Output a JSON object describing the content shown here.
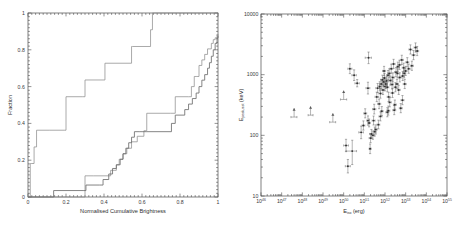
{
  "figure": {
    "panel_count": 2
  },
  "chart_data": [
    {
      "type": "line",
      "panel": "left",
      "title": "",
      "xlabel": "Normalised Cumulative Brightness",
      "ylabel": "Fraction",
      "xlim": [
        0,
        1
      ],
      "ylim": [
        0,
        1
      ],
      "xticks": [
        0,
        0.2,
        0.4,
        0.6,
        0.8,
        1
      ],
      "xticklabels": [
        "0",
        "0.2",
        "0.4",
        "0.6",
        "0.8",
        "1"
      ],
      "yticks": [
        0,
        0.2,
        0.4,
        0.6,
        0.8,
        1
      ],
      "yticklabels": [
        "0",
        "0.2",
        "0.4",
        "0.6",
        "0.8",
        "1"
      ],
      "grid": false,
      "legend": "none",
      "drawstyle": "steps-post",
      "series": [
        {
          "name": "upper-left cumulative distribution",
          "color": "#8d8d8d",
          "x": [
            0.0,
            0.012,
            0.02,
            0.032,
            0.045,
            0.115,
            0.19,
            0.2,
            0.285,
            0.3,
            0.4,
            0.405,
            0.5,
            0.545,
            0.55,
            0.645,
            0.655,
            1.0
          ],
          "y": [
            0.0,
            0.182,
            0.182,
            0.272,
            0.363,
            0.363,
            0.363,
            0.545,
            0.545,
            0.636,
            0.636,
            0.727,
            0.727,
            0.818,
            0.818,
            0.909,
            1.0,
            1.0
          ]
        },
        {
          "name": "lower-right cumulative distribution (thin)",
          "color": "#8d8d8d",
          "x": [
            0.0,
            0.125,
            0.29,
            0.3,
            0.345,
            0.4,
            0.435,
            0.465,
            0.48,
            0.5,
            0.52,
            0.545,
            0.575,
            0.61,
            0.625,
            0.75,
            0.775,
            0.8,
            0.845,
            0.86,
            0.875,
            0.885,
            0.9,
            0.915,
            0.93,
            0.945,
            0.955,
            0.965,
            0.975,
            0.985,
            0.995,
            1.0
          ],
          "y": [
            0.0,
            0.0,
            0.0,
            0.115,
            0.115,
            0.115,
            0.145,
            0.175,
            0.205,
            0.235,
            0.265,
            0.3,
            0.33,
            0.36,
            0.455,
            0.455,
            0.545,
            0.545,
            0.545,
            0.6,
            0.655,
            0.655,
            0.715,
            0.745,
            0.775,
            0.805,
            0.805,
            0.835,
            0.855,
            0.865,
            0.875,
            0.885
          ]
        },
        {
          "name": "lower-right cumulative distribution (thick)",
          "color": "#6e6e6e",
          "x": [
            0.0,
            0.125,
            0.135,
            0.29,
            0.305,
            0.375,
            0.395,
            0.425,
            0.445,
            0.465,
            0.485,
            0.5,
            0.515,
            0.53,
            0.545,
            0.56,
            0.585,
            0.605,
            0.625,
            0.7,
            0.755,
            0.775,
            0.8,
            0.825,
            0.845,
            0.865,
            0.885,
            0.9,
            0.915,
            0.93,
            0.945,
            0.955,
            0.965,
            0.975,
            0.985,
            0.995,
            1.0
          ],
          "y": [
            0.0,
            0.0,
            0.035,
            0.035,
            0.065,
            0.065,
            0.095,
            0.125,
            0.155,
            0.175,
            0.205,
            0.235,
            0.265,
            0.295,
            0.325,
            0.355,
            0.355,
            0.355,
            0.355,
            0.355,
            0.4,
            0.445,
            0.445,
            0.475,
            0.505,
            0.535,
            0.565,
            0.6,
            0.635,
            0.665,
            0.7,
            0.73,
            0.765,
            0.8,
            0.835,
            0.865,
            0.875
          ]
        }
      ]
    },
    {
      "type": "scatter",
      "panel": "right",
      "title": "",
      "xlabel": "E_iso (erg)",
      "xlabel_base": "E",
      "xlabel_sub": "iso",
      "xlabel_unit": "(erg)",
      "ylabel": "E_peak,rest (keV)",
      "ylabel_base": "E",
      "ylabel_sub": "peak,rest",
      "ylabel_unit": "(keV)",
      "xscale": "log",
      "yscale": "log",
      "xlim": [
        1e+46,
        1e+55
      ],
      "ylim": [
        10,
        10000
      ],
      "xticks_exp": [
        46,
        47,
        48,
        49,
        50,
        51,
        52,
        53,
        54,
        55
      ],
      "yticklabels": [
        "10",
        "100",
        "1000",
        "10000"
      ],
      "yticks": [
        10,
        100,
        1000,
        10000
      ],
      "grid": false,
      "legend": "none",
      "marker_kinds": [
        "point-with-errorbars",
        "lower-limit-arrow"
      ],
      "points": [
        {
          "x": 4e+47,
          "y": 200,
          "xerr_lo": 1.2e+47,
          "xerr_hi": 1.5e+47,
          "yerr_lo": 0,
          "yerr_hi": 0,
          "limit": "lower"
        },
        {
          "x": 2.5e+48,
          "y": 215,
          "xerr_lo": 6e+47,
          "xerr_hi": 8e+47,
          "yerr_lo": 0,
          "yerr_hi": 0,
          "limit": "lower"
        },
        {
          "x": 3e+49,
          "y": 165,
          "xerr_lo": 9e+48,
          "xerr_hi": 1.1e+49,
          "yerr_lo": 0,
          "yerr_hi": 0,
          "limit": "lower"
        },
        {
          "x": 1e+50,
          "y": 390,
          "xerr_lo": 3e+49,
          "xerr_hi": 4e+49,
          "yerr_lo": 0,
          "yerr_hi": 0,
          "limit": "lower"
        },
        {
          "x": 2e+50,
          "y": 1250,
          "xerr_lo": 4e+49,
          "xerr_hi": 5e+49,
          "yerr_lo": 210,
          "yerr_hi": 260
        },
        {
          "x": 3.2e+50,
          "y": 980,
          "xerr_lo": 7e+49,
          "xerr_hi": 9e+49,
          "yerr_lo": 180,
          "yerr_hi": 220
        },
        {
          "x": 4.5e+50,
          "y": 720,
          "xerr_lo": 1e+50,
          "xerr_hi": 1.2e+50,
          "yerr_lo": 90,
          "yerr_hi": 110
        },
        {
          "x": 1.3e+50,
          "y": 68,
          "xerr_lo": 3e+49,
          "xerr_hi": 4e+49,
          "yerr_lo": 14,
          "yerr_hi": 18
        },
        {
          "x": 1.6e+50,
          "y": 31,
          "xerr_lo": 4e+49,
          "xerr_hi": 5e+49,
          "yerr_lo": 7,
          "yerr_hi": 9
        },
        {
          "x": 2.6e+50,
          "y": 55,
          "xerr_lo": 1.3e+50,
          "xerr_hi": 1.6e+50,
          "yerr_lo": 22,
          "yerr_hi": 28
        },
        {
          "x": 7e+50,
          "y": 112,
          "xerr_lo": 1.6e+50,
          "xerr_hi": 2e+50,
          "yerr_lo": 24,
          "yerr_hi": 30
        },
        {
          "x": 1.6e+51,
          "y": 1900,
          "xerr_lo": 5e+50,
          "xerr_hi": 6e+50,
          "yerr_lo": 380,
          "yerr_hi": 460
        },
        {
          "x": 1.5e+51,
          "y": 600,
          "xerr_lo": 3e+50,
          "xerr_hi": 3.5e+50,
          "yerr_lo": 120,
          "yerr_hi": 150
        },
        {
          "x": 1.5e+51,
          "y": 175,
          "xerr_lo": 2e+50,
          "xerr_hi": 2.5e+50,
          "yerr_lo": 28,
          "yerr_hi": 34
        },
        {
          "x": 1.7e+51,
          "y": 160,
          "xerr_lo": 2e+50,
          "xerr_hi": 2.5e+50,
          "yerr_lo": 22,
          "yerr_hi": 26
        },
        {
          "x": 1.9e+51,
          "y": 60,
          "xerr_lo": 2e+50,
          "xerr_hi": 2.5e+50,
          "yerr_lo": 10,
          "yerr_hi": 12
        },
        {
          "x": 2.2e+51,
          "y": 105,
          "xerr_lo": 4e+50,
          "xerr_hi": 5e+50,
          "yerr_lo": 16,
          "yerr_hi": 20
        },
        {
          "x": 2.6e+51,
          "y": 100,
          "xerr_lo": 3e+50,
          "xerr_hi": 4e+50,
          "yerr_lo": 14,
          "yerr_hi": 18
        },
        {
          "x": 3e+51,
          "y": 270,
          "xerr_lo": 5e+50,
          "xerr_hi": 6e+50,
          "yerr_lo": 45,
          "yerr_hi": 55
        },
        {
          "x": 3.2e+51,
          "y": 115,
          "xerr_lo": 4e+50,
          "xerr_hi": 5e+50,
          "yerr_lo": 18,
          "yerr_hi": 22
        },
        {
          "x": 3.6e+51,
          "y": 125,
          "xerr_lo": 5e+50,
          "xerr_hi": 6e+50,
          "yerr_lo": 20,
          "yerr_hi": 24
        },
        {
          "x": 4e+51,
          "y": 430,
          "xerr_lo": 7e+50,
          "xerr_hi": 9e+50,
          "yerr_lo": 70,
          "yerr_hi": 85
        },
        {
          "x": 4.4e+51,
          "y": 600,
          "xerr_lo": 8e+50,
          "xerr_hi": 1e+51,
          "yerr_lo": 95,
          "yerr_hi": 115
        },
        {
          "x": 4.8e+51,
          "y": 150,
          "xerr_lo": 6e+50,
          "xerr_hi": 8e+50,
          "yerr_lo": 22,
          "yerr_hi": 28
        },
        {
          "x": 5.2e+51,
          "y": 330,
          "xerr_lo": 8e+50,
          "xerr_hi": 1e+51,
          "yerr_lo": 55,
          "yerr_hi": 65
        },
        {
          "x": 5.6e+51,
          "y": 640,
          "xerr_lo": 9e+50,
          "xerr_hi": 1.1e+51,
          "yerr_lo": 100,
          "yerr_hi": 125
        },
        {
          "x": 6e+51,
          "y": 490,
          "xerr_lo": 1e+51,
          "xerr_hi": 1.2e+51,
          "yerr_lo": 80,
          "yerr_hi": 95
        },
        {
          "x": 6.5e+51,
          "y": 700,
          "xerr_lo": 1.1e+51,
          "xerr_hi": 1.3e+51,
          "yerr_lo": 110,
          "yerr_hi": 135
        },
        {
          "x": 7e+51,
          "y": 250,
          "xerr_lo": 9e+50,
          "xerr_hi": 1.1e+51,
          "yerr_lo": 40,
          "yerr_hi": 48
        },
        {
          "x": 7.5e+51,
          "y": 820,
          "xerr_lo": 1.2e+51,
          "xerr_hi": 1.5e+51,
          "yerr_lo": 130,
          "yerr_hi": 160
        },
        {
          "x": 8e+51,
          "y": 560,
          "xerr_lo": 1.2e+51,
          "xerr_hi": 1.4e+51,
          "yerr_lo": 90,
          "yerr_hi": 110
        },
        {
          "x": 8.5e+51,
          "y": 760,
          "xerr_lo": 1.3e+51,
          "xerr_hi": 1.6e+51,
          "yerr_lo": 120,
          "yerr_hi": 145
        },
        {
          "x": 9e+51,
          "y": 1150,
          "xerr_lo": 1.4e+51,
          "xerr_hi": 1.7e+51,
          "yerr_lo": 180,
          "yerr_hi": 220
        },
        {
          "x": 9.5e+51,
          "y": 880,
          "xerr_lo": 1.5e+51,
          "xerr_hi": 1.8e+51,
          "yerr_lo": 140,
          "yerr_hi": 170
        },
        {
          "x": 1e+52,
          "y": 640,
          "xerr_lo": 1.5e+51,
          "xerr_hi": 1.8e+51,
          "yerr_lo": 100,
          "yerr_hi": 125
        },
        {
          "x": 1.1e+52,
          "y": 700,
          "xerr_lo": 1.7e+51,
          "xerr_hi": 2e+51,
          "yerr_lo": 110,
          "yerr_hi": 135
        },
        {
          "x": 1.2e+52,
          "y": 790,
          "xerr_lo": 1.8e+51,
          "xerr_hi": 2.2e+51,
          "yerr_lo": 125,
          "yerr_hi": 150
        },
        {
          "x": 1.3e+52,
          "y": 620,
          "xerr_lo": 2e+51,
          "xerr_hi": 2.4e+51,
          "yerr_lo": 98,
          "yerr_hi": 120
        },
        {
          "x": 1.4e+52,
          "y": 980,
          "xerr_lo": 2.1e+51,
          "xerr_hi": 2.6e+51,
          "yerr_lo": 155,
          "yerr_hi": 190
        },
        {
          "x": 1.5e+52,
          "y": 430,
          "xerr_lo": 2.2e+51,
          "xerr_hi": 2.7e+51,
          "yerr_lo": 68,
          "yerr_hi": 82
        },
        {
          "x": 1.6e+52,
          "y": 1050,
          "xerr_lo": 2.4e+51,
          "xerr_hi": 2.9e+51,
          "yerr_lo": 165,
          "yerr_hi": 200
        },
        {
          "x": 1.7e+52,
          "y": 350,
          "xerr_lo": 2.5e+51,
          "xerr_hi": 3.1e+51,
          "yerr_lo": 55,
          "yerr_hi": 68
        },
        {
          "x": 1.8e+52,
          "y": 800,
          "xerr_lo": 2.7e+51,
          "xerr_hi": 3.3e+51,
          "yerr_lo": 126,
          "yerr_hi": 155
        },
        {
          "x": 2e+52,
          "y": 1250,
          "xerr_lo": 3e+51,
          "xerr_hi": 3.6e+51,
          "yerr_lo": 198,
          "yerr_hi": 240
        },
        {
          "x": 2.2e+52,
          "y": 690,
          "xerr_lo": 3.3e+51,
          "xerr_hi": 4e+51,
          "yerr_lo": 110,
          "yerr_hi": 132
        },
        {
          "x": 2.4e+52,
          "y": 900,
          "xerr_lo": 3.6e+51,
          "xerr_hi": 4.4e+51,
          "yerr_lo": 142,
          "yerr_hi": 172
        },
        {
          "x": 2.6e+52,
          "y": 1500,
          "xerr_lo": 3.9e+51,
          "xerr_hi": 4.7e+51,
          "yerr_lo": 240,
          "yerr_hi": 290
        },
        {
          "x": 2.8e+52,
          "y": 260,
          "xerr_lo": 4.2e+51,
          "xerr_hi": 5e+51,
          "yerr_lo": 41,
          "yerr_hi": 50
        },
        {
          "x": 3e+52,
          "y": 320,
          "xerr_lo": 4.5e+51,
          "xerr_hi": 5.4e+51,
          "yerr_lo": 50,
          "yerr_hi": 62
        },
        {
          "x": 3.4e+52,
          "y": 1100,
          "xerr_lo": 5.1e+51,
          "xerr_hi": 6.1e+51,
          "yerr_lo": 175,
          "yerr_hi": 210
        },
        {
          "x": 3.8e+52,
          "y": 700,
          "xerr_lo": 5.7e+51,
          "xerr_hi": 6.8e+51,
          "yerr_lo": 110,
          "yerr_hi": 135
        },
        {
          "x": 4.2e+52,
          "y": 1350,
          "xerr_lo": 6.3e+51,
          "xerr_hi": 7.6e+51,
          "yerr_lo": 215,
          "yerr_hi": 260
        },
        {
          "x": 4.6e+52,
          "y": 560,
          "xerr_lo": 6.9e+51,
          "xerr_hi": 8.3e+51,
          "yerr_lo": 88,
          "yerr_hi": 108
        },
        {
          "x": 5.2e+52,
          "y": 900,
          "xerr_lo": 7.8e+51,
          "xerr_hi": 9.4e+51,
          "yerr_lo": 142,
          "yerr_hi": 172
        },
        {
          "x": 5.8e+52,
          "y": 280,
          "xerr_lo": 8.7e+51,
          "xerr_hi": 1e+52,
          "yerr_lo": 44,
          "yerr_hi": 54
        },
        {
          "x": 6.5e+52,
          "y": 1750,
          "xerr_lo": 9.8e+51,
          "xerr_hi": 1.2e+52,
          "yerr_lo": 280,
          "yerr_hi": 340
        },
        {
          "x": 7.2e+52,
          "y": 950,
          "xerr_lo": 1.1e+52,
          "xerr_hi": 1.3e+52,
          "yerr_lo": 150,
          "yerr_hi": 182
        },
        {
          "x": 8e+52,
          "y": 1300,
          "xerr_lo": 1.2e+52,
          "xerr_hi": 1.4e+52,
          "yerr_lo": 206,
          "yerr_hi": 250
        },
        {
          "x": 9e+52,
          "y": 700,
          "xerr_lo": 1.4e+52,
          "xerr_hi": 1.6e+52,
          "yerr_lo": 110,
          "yerr_hi": 135
        },
        {
          "x": 1e+53,
          "y": 1150,
          "xerr_lo": 1.5e+52,
          "xerr_hi": 1.8e+52,
          "yerr_lo": 182,
          "yerr_hi": 220
        },
        {
          "x": 1.2e+53,
          "y": 1600,
          "xerr_lo": 1.8e+52,
          "xerr_hi": 2.2e+52,
          "yerr_lo": 254,
          "yerr_hi": 308
        },
        {
          "x": 1.4e+53,
          "y": 1250,
          "xerr_lo": 2.1e+52,
          "xerr_hi": 2.5e+52,
          "yerr_lo": 198,
          "yerr_hi": 240
        },
        {
          "x": 1.7e+53,
          "y": 2600,
          "xerr_lo": 2.6e+52,
          "xerr_hi": 3.1e+52,
          "yerr_lo": 412,
          "yerr_hi": 500
        },
        {
          "x": 2e+53,
          "y": 1400,
          "xerr_lo": 3e+52,
          "xerr_hi": 3.6e+52,
          "yerr_lo": 222,
          "yerr_hi": 270
        },
        {
          "x": 2.4e+53,
          "y": 2100,
          "xerr_lo": 3.6e+52,
          "xerr_hi": 4.3e+52,
          "yerr_lo": 333,
          "yerr_hi": 404
        },
        {
          "x": 3e+53,
          "y": 2800,
          "xerr_lo": 4.5e+52,
          "xerr_hi": 5.4e+52,
          "yerr_lo": 444,
          "yerr_hi": 538
        },
        {
          "x": 3.6e+53,
          "y": 2450,
          "xerr_lo": 5.4e+52,
          "xerr_hi": 6.5e+52,
          "yerr_lo": 388,
          "yerr_hi": 471
        },
        {
          "x": 6e+51,
          "y": 205,
          "xerr_lo": 9e+50,
          "xerr_hi": 1.1e+51,
          "yerr_lo": 32,
          "yerr_hi": 39
        },
        {
          "x": 2.8e+51,
          "y": 175,
          "xerr_lo": 4.2e+50,
          "xerr_hi": 5e+50,
          "yerr_lo": 27,
          "yerr_hi": 33
        },
        {
          "x": 9e+50,
          "y": 145,
          "xerr_lo": 1.3e+50,
          "xerr_hi": 1.6e+50,
          "yerr_lo": 23,
          "yerr_hi": 28
        },
        {
          "x": 1.1e+51,
          "y": 230,
          "xerr_lo": 1.6e+50,
          "xerr_hi": 2e+50,
          "yerr_lo": 36,
          "yerr_hi": 44
        },
        {
          "x": 2e+51,
          "y": 90,
          "xerr_lo": 3e+50,
          "xerr_hi": 3.6e+50,
          "yerr_lo": 14,
          "yerr_hi": 17
        },
        {
          "x": 1.3e+52,
          "y": 240,
          "xerr_lo": 2e+51,
          "xerr_hi": 2.4e+51,
          "yerr_lo": 38,
          "yerr_hi": 46
        },
        {
          "x": 1.45e+52,
          "y": 255,
          "xerr_lo": 2.2e+51,
          "xerr_hi": 2.6e+51,
          "yerr_lo": 40,
          "yerr_hi": 49
        },
        {
          "x": 2.3e+52,
          "y": 500,
          "xerr_lo": 3.5e+51,
          "xerr_hi": 4.1e+51,
          "yerr_lo": 79,
          "yerr_hi": 96
        },
        {
          "x": 3.2e+52,
          "y": 620,
          "xerr_lo": 4.8e+51,
          "xerr_hi": 5.8e+51,
          "yerr_lo": 98,
          "yerr_hi": 119
        },
        {
          "x": 4e+52,
          "y": 1050,
          "xerr_lo": 6e+51,
          "xerr_hi": 7.2e+51,
          "yerr_lo": 166,
          "yerr_hi": 202
        },
        {
          "x": 5e+52,
          "y": 1450,
          "xerr_lo": 7.5e+51,
          "xerr_hi": 9e+51,
          "yerr_lo": 230,
          "yerr_hi": 279
        },
        {
          "x": 7e+52,
          "y": 380,
          "xerr_lo": 1.05e+52,
          "xerr_hi": 1.26e+52,
          "yerr_lo": 60,
          "yerr_hi": 73
        },
        {
          "x": 8.5e+52,
          "y": 1050,
          "xerr_lo": 1.3e+52,
          "xerr_hi": 1.5e+52,
          "yerr_lo": 166,
          "yerr_hi": 202
        }
      ]
    }
  ]
}
